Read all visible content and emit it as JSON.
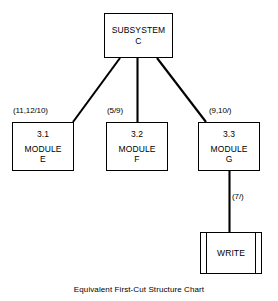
{
  "diagram": {
    "caption": "Equivalent First-Cut Structure Chart",
    "type": "structure-chart",
    "nodes": [
      {
        "key": "subsystem",
        "id": "",
        "name": "SUBSYSTEM\nC",
        "shape": "rectangle"
      },
      {
        "key": "module_e",
        "id": "3.1",
        "name": "MODULE\nE",
        "shape": "rectangle"
      },
      {
        "key": "module_f",
        "id": "3.2",
        "name": "MODULE\nF",
        "shape": "rectangle"
      },
      {
        "key": "module_g",
        "id": "3.3",
        "name": "MODULE\nG",
        "shape": "rectangle"
      },
      {
        "key": "write",
        "id": "",
        "name": "WRITE",
        "shape": "predefined-process"
      }
    ],
    "edges": [
      {
        "from": "subsystem",
        "to": "module_e",
        "label": "(11,12/10)"
      },
      {
        "from": "subsystem",
        "to": "module_f",
        "label": "(5/9)"
      },
      {
        "from": "subsystem",
        "to": "module_g",
        "label": "(9,10/)"
      },
      {
        "from": "module_g",
        "to": "write",
        "label": "(7/)"
      }
    ],
    "colors": {
      "line": "#000000",
      "fill": "#ffffff",
      "text": "#000000"
    }
  }
}
